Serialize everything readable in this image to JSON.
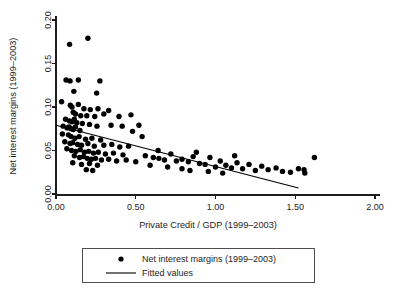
{
  "chart_data": {
    "type": "scatter",
    "title": "",
    "xlabel": "Private Credit / GDP (1999–2003)",
    "ylabel": "Net interest margins (1999–2003)",
    "xlim": [
      0.0,
      2.0
    ],
    "ylim": [
      0.0,
      0.2
    ],
    "xticks": [
      0.0,
      0.5,
      1.0,
      1.5,
      2.0
    ],
    "xtick_labels": [
      "0.00",
      "0.50",
      "1.00",
      "1.50",
      "2.00"
    ],
    "yticks": [
      0.0,
      0.05,
      0.1,
      0.15,
      0.2
    ],
    "ytick_labels": [
      "0.00",
      "0.05",
      "0.10",
      "0.15",
      "0.20"
    ],
    "grid": false,
    "legend_position": "bottom-center",
    "series": [
      {
        "name": "Net interest margins (1999–2003)",
        "marker": "circle",
        "color": "#000000",
        "points": [
          [
            0.085,
            0.172
          ],
          [
            0.2,
            0.179
          ],
          [
            0.063,
            0.131
          ],
          [
            0.088,
            0.13
          ],
          [
            0.14,
            0.131
          ],
          [
            0.275,
            0.13
          ],
          [
            0.112,
            0.118
          ],
          [
            0.255,
            0.116
          ],
          [
            0.035,
            0.106
          ],
          [
            0.09,
            0.102
          ],
          [
            0.1,
            0.1
          ],
          [
            0.14,
            0.103
          ],
          [
            0.175,
            0.098
          ],
          [
            0.215,
            0.097
          ],
          [
            0.263,
            0.098
          ],
          [
            0.33,
            0.096
          ],
          [
            0.108,
            0.094
          ],
          [
            0.122,
            0.092
          ],
          [
            0.155,
            0.09
          ],
          [
            0.193,
            0.09
          ],
          [
            0.243,
            0.089
          ],
          [
            0.3,
            0.092
          ],
          [
            0.395,
            0.089
          ],
          [
            0.47,
            0.091
          ],
          [
            0.06,
            0.086
          ],
          [
            0.085,
            0.084
          ],
          [
            0.1,
            0.083
          ],
          [
            0.115,
            0.086
          ],
          [
            0.13,
            0.082
          ],
          [
            0.165,
            0.081
          ],
          [
            0.21,
            0.08
          ],
          [
            0.257,
            0.078
          ],
          [
            0.345,
            0.079
          ],
          [
            0.415,
            0.078
          ],
          [
            0.52,
            0.079
          ],
          [
            0.045,
            0.078
          ],
          [
            0.07,
            0.076
          ],
          [
            0.082,
            0.077
          ],
          [
            0.095,
            0.075
          ],
          [
            0.108,
            0.074
          ],
          [
            0.122,
            0.077
          ],
          [
            0.15,
            0.073
          ],
          [
            0.04,
            0.069
          ],
          [
            0.078,
            0.068
          ],
          [
            0.095,
            0.066
          ],
          [
            0.118,
            0.064
          ],
          [
            0.145,
            0.066
          ],
          [
            0.185,
            0.063
          ],
          [
            0.225,
            0.064
          ],
          [
            0.28,
            0.062
          ],
          [
            0.055,
            0.06
          ],
          [
            0.088,
            0.058
          ],
          [
            0.105,
            0.059
          ],
          [
            0.135,
            0.057
          ],
          [
            0.16,
            0.056
          ],
          [
            0.2,
            0.058
          ],
          [
            0.24,
            0.055
          ],
          [
            0.3,
            0.056
          ],
          [
            0.35,
            0.057
          ],
          [
            0.4,
            0.054
          ],
          [
            0.455,
            0.055
          ],
          [
            0.068,
            0.052
          ],
          [
            0.098,
            0.05
          ],
          [
            0.125,
            0.049
          ],
          [
            0.152,
            0.051
          ],
          [
            0.178,
            0.048
          ],
          [
            0.205,
            0.049
          ],
          [
            0.235,
            0.047
          ],
          [
            0.265,
            0.048
          ],
          [
            0.31,
            0.046
          ],
          [
            0.36,
            0.047
          ],
          [
            0.42,
            0.045
          ],
          [
            0.115,
            0.044
          ],
          [
            0.148,
            0.042
          ],
          [
            0.172,
            0.043
          ],
          [
            0.196,
            0.041
          ],
          [
            0.222,
            0.04
          ],
          [
            0.248,
            0.041
          ],
          [
            0.285,
            0.039
          ],
          [
            0.33,
            0.04
          ],
          [
            0.38,
            0.038
          ],
          [
            0.44,
            0.039
          ],
          [
            0.5,
            0.037
          ],
          [
            0.105,
            0.036
          ],
          [
            0.16,
            0.034
          ],
          [
            0.21,
            0.035
          ],
          [
            0.26,
            0.033
          ],
          [
            0.19,
            0.028
          ],
          [
            0.23,
            0.027
          ],
          [
            0.56,
            0.044
          ],
          [
            0.61,
            0.042
          ],
          [
            0.645,
            0.041
          ],
          [
            0.68,
            0.039
          ],
          [
            0.72,
            0.046
          ],
          [
            0.755,
            0.038
          ],
          [
            0.79,
            0.04
          ],
          [
            0.83,
            0.037
          ],
          [
            0.86,
            0.043
          ],
          [
            0.9,
            0.035
          ],
          [
            0.935,
            0.034
          ],
          [
            0.965,
            0.042
          ],
          [
            1.0,
            0.031
          ],
          [
            1.03,
            0.038
          ],
          [
            1.065,
            0.033
          ],
          [
            1.1,
            0.03
          ],
          [
            1.135,
            0.036
          ],
          [
            1.17,
            0.029
          ],
          [
            1.21,
            0.034
          ],
          [
            1.25,
            0.027
          ],
          [
            1.29,
            0.032
          ],
          [
            1.33,
            0.028
          ],
          [
            1.38,
            0.03
          ],
          [
            1.42,
            0.026
          ],
          [
            1.47,
            0.025
          ],
          [
            1.52,
            0.029
          ],
          [
            1.56,
            0.024
          ],
          [
            1.62,
            0.042
          ],
          [
            1.555,
            0.028
          ],
          [
            1.12,
            0.044
          ],
          [
            0.88,
            0.048
          ],
          [
            0.64,
            0.05
          ],
          [
            0.54,
            0.066
          ],
          [
            0.48,
            0.072
          ],
          [
            0.59,
            0.033
          ],
          [
            0.7,
            0.031
          ],
          [
            0.79,
            0.029
          ],
          [
            0.84,
            0.027
          ],
          [
            0.955,
            0.026
          ],
          [
            1.045,
            0.024
          ]
        ]
      }
    ],
    "fit": {
      "name": "Fitted values",
      "color": "#000000",
      "x_start": 0.0,
      "y_start": 0.079,
      "x_end": 1.52,
      "y_end": 0.007
    }
  },
  "legend": {
    "entries": [
      {
        "label": "Net interest margins (1999–2003)",
        "marker": "dot"
      },
      {
        "label": "Fitted values",
        "marker": "line"
      }
    ]
  },
  "axes": {
    "x_title": "Private Credit / GDP (1999–2003)",
    "y_title": "Net interest margins (1999–2003)"
  }
}
